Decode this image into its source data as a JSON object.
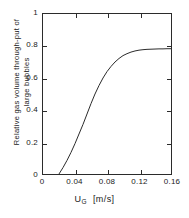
{
  "chart_data": {
    "type": "line",
    "title": "",
    "xlabel": "U_G  [m/s]",
    "xlabel_symbol": "U",
    "xlabel_subscript": "G",
    "xlabel_units": "[m/s]",
    "ylabel_line1": "Relative gas volume  through-put  of",
    "ylabel_line2": "large  bubbles",
    "xlim": [
      0,
      0.16
    ],
    "ylim": [
      0,
      1
    ],
    "xticks": [
      "0",
      "0.04",
      "0.08",
      "0.12",
      "0.16"
    ],
    "xtick_values": [
      0,
      0.04,
      0.08,
      0.12,
      0.16
    ],
    "yticks": [
      "0",
      "0.2",
      "0.4",
      "0.6",
      "0.8",
      "1"
    ],
    "ytick_values": [
      0,
      0.2,
      0.4,
      0.6,
      0.8,
      1
    ],
    "grid": false,
    "legend": null,
    "series": [
      {
        "name": "Relative gas volume through-put of large bubbles",
        "color": "#2b2b2b",
        "x": [
          0.02,
          0.025,
          0.03,
          0.035,
          0.04,
          0.045,
          0.05,
          0.055,
          0.06,
          0.065,
          0.07,
          0.075,
          0.08,
          0.085,
          0.09,
          0.095,
          0.1,
          0.105,
          0.11,
          0.115,
          0.12,
          0.125,
          0.13,
          0.135,
          0.14,
          0.145,
          0.15,
          0.155,
          0.16
        ],
        "y": [
          0.0,
          0.04,
          0.085,
          0.135,
          0.19,
          0.25,
          0.31,
          0.375,
          0.44,
          0.5,
          0.553,
          0.6,
          0.64,
          0.672,
          0.7,
          0.722,
          0.74,
          0.752,
          0.762,
          0.769,
          0.774,
          0.777,
          0.779,
          0.78,
          0.781,
          0.782,
          0.782,
          0.783,
          0.783
        ]
      }
    ]
  }
}
